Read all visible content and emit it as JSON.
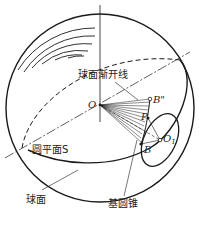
{
  "diagram": {
    "labels": {
      "involute": "球面渐开线",
      "origin": "O",
      "b_double_prime": "B\"",
      "p": "P",
      "o1": "O",
      "o1_sub": "1",
      "b": "B",
      "circle_plane": "圆平面S",
      "sphere": "球面",
      "base_cone": "基圆锥"
    },
    "colors": {
      "stroke": "#1a1a1a",
      "background": "#ffffff"
    }
  }
}
